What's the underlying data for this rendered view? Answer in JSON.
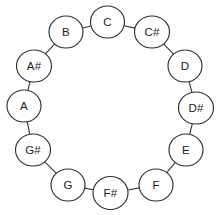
{
  "diagram": {
    "type": "cycle-graph",
    "background_color": "#ffffff",
    "node_fill_color": "#ffffff",
    "node_stroke_color": "#2f2f2f",
    "edge_color": "#3a3a3a",
    "label_color": "#1d1d1d",
    "node_count": 12,
    "nodes": [
      {
        "id": "C",
        "label": "C",
        "cx": 107.5,
        "cy": 22,
        "rx": 17.0,
        "ry": 16.0
      },
      {
        "id": "Cs",
        "label": "C#",
        "cx": 152.0,
        "cy": 32.0,
        "rx": 17.5,
        "ry": 16.0
      },
      {
        "id": "D",
        "label": "D",
        "cx": 185.0,
        "cy": 66.0,
        "rx": 17.0,
        "ry": 16.0
      },
      {
        "id": "Ds",
        "label": "D#",
        "cx": 196.0,
        "cy": 108.0,
        "rx": 17.5,
        "ry": 16.0
      },
      {
        "id": "E",
        "label": "E",
        "cx": 186.0,
        "cy": 150.0,
        "rx": 17.0,
        "ry": 16.0
      },
      {
        "id": "F",
        "label": "F",
        "cx": 156.0,
        "cy": 185.0,
        "rx": 17.0,
        "ry": 16.0
      },
      {
        "id": "Fs",
        "label": "F#",
        "cx": 110.5,
        "cy": 193.0,
        "rx": 17.5,
        "ry": 16.5
      },
      {
        "id": "G",
        "label": "G",
        "cx": 68.0,
        "cy": 185.0,
        "rx": 17.0,
        "ry": 16.0
      },
      {
        "id": "Gs",
        "label": "G#",
        "cx": 33.0,
        "cy": 150.0,
        "rx": 17.5,
        "ry": 16.0
      },
      {
        "id": "A",
        "label": "A",
        "cx": 24.0,
        "cy": 106.0,
        "rx": 17.0,
        "ry": 16.0
      },
      {
        "id": "As",
        "label": "A#",
        "cx": 34.0,
        "cy": 66.0,
        "rx": 17.5,
        "ry": 16.0
      },
      {
        "id": "B",
        "label": "B",
        "cx": 66.0,
        "cy": 32.0,
        "rx": 17.0,
        "ry": 16.0
      }
    ],
    "edges": [
      {
        "from": "C",
        "to": "Cs"
      },
      {
        "from": "Cs",
        "to": "D"
      },
      {
        "from": "D",
        "to": "Ds"
      },
      {
        "from": "Ds",
        "to": "E"
      },
      {
        "from": "E",
        "to": "F"
      },
      {
        "from": "F",
        "to": "Fs"
      },
      {
        "from": "Fs",
        "to": "G"
      },
      {
        "from": "G",
        "to": "Gs"
      },
      {
        "from": "Gs",
        "to": "A"
      },
      {
        "from": "A",
        "to": "As"
      },
      {
        "from": "As",
        "to": "B"
      },
      {
        "from": "B",
        "to": "C"
      }
    ]
  },
  "chart_data": {
    "type": "diagram",
    "categories": [
      "C",
      "C#",
      "D",
      "D#",
      "E",
      "F",
      "F#",
      "G",
      "G#",
      "A",
      "A#",
      "B"
    ],
    "values": [
      0,
      1,
      2,
      3,
      4,
      5,
      6,
      7,
      8,
      9,
      10,
      11
    ],
    "xlabel": "",
    "ylabel": "",
    "legend": [],
    "grid": false
  }
}
